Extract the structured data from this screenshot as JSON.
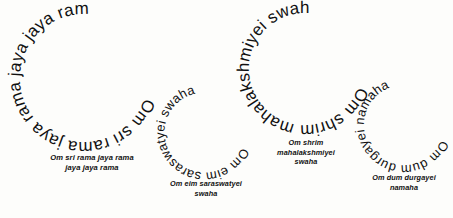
{
  "page": {
    "background_color": "#fdfdfb",
    "ink_color": "#111111"
  },
  "mantras": [
    {
      "id": "sri-rama",
      "ring_text": "Om sri rama jaya rama jaya jaya rama ",
      "caption": "Om sri rama jaya rama\njaya jaya rama",
      "caption_line_1": "Om sri rama jaya rama",
      "caption_line_2": "jaya jaya rama",
      "ring_font_size": 17,
      "radius": 64,
      "start_offset_percent": 30,
      "direction": "clockwise"
    },
    {
      "id": "saraswatyei",
      "ring_text": "Om eim saraswatyei swaha ",
      "caption": "Om eim saraswatyei\nswaha",
      "caption_line_1": "Om eim saraswatyei",
      "caption_line_2": "swaha",
      "ring_font_size": 13,
      "radius": 40,
      "start_offset_percent": 31,
      "direction": "clockwise"
    },
    {
      "id": "mahalakshmiyei",
      "ring_text": "Om shrim mahalakshmiyei swaha ",
      "caption": "Om shrim\nmahalakshmiyei\nswaha",
      "caption_line_1": "Om shrim",
      "caption_line_2": "mahalakshmiyei",
      "caption_line_3": "swaha",
      "ring_font_size": 17,
      "radius": 56,
      "start_offset_percent": 30,
      "direction": "clockwise"
    },
    {
      "id": "durgayei",
      "ring_text": "Om dum durgayei namaha ",
      "caption": "Om dum durgayei\nnamaha",
      "caption_line_1": "Om dum durgayei",
      "caption_line_2": "namaha",
      "ring_font_size": 13,
      "radius": 40,
      "start_offset_percent": 31,
      "direction": "clockwise"
    }
  ]
}
